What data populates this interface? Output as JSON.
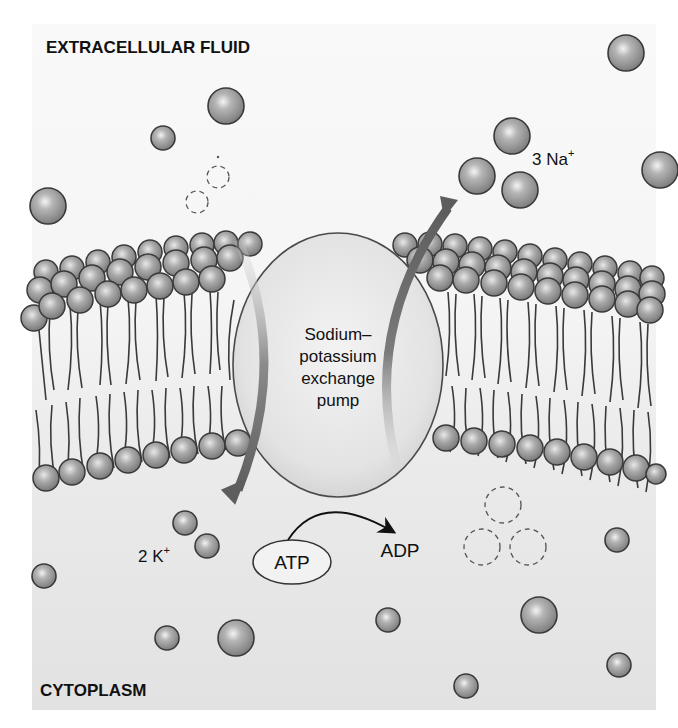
{
  "diagram": {
    "regions": {
      "top_label": "EXTRACELLULAR FLUID",
      "bottom_label": "CYTOPLASM"
    },
    "pump_label_lines": [
      "Sodium–",
      "potassium",
      "exchange",
      "pump"
    ],
    "ions": {
      "sodium_label": "3 Na",
      "sodium_superscript": "+",
      "potassium_label": "2 K",
      "potassium_superscript": "+"
    },
    "energy": {
      "atp_label": "ATP",
      "adp_label": "ADP"
    },
    "colors": {
      "extracellular_bg": "#f7f7f7",
      "cytoplasm_bg": "#e4e4e4",
      "ion_fill": "#9a9a9a",
      "ion_stroke": "#3a3a3a",
      "pump_fill": "#e8e8e8",
      "arrow": "#6b6b6b",
      "text": "#111111"
    }
  }
}
